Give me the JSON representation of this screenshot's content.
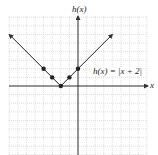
{
  "chart_data": {
    "type": "line",
    "title": "",
    "function_label": "h(x) = |x + 2|",
    "xlabel": "x",
    "ylabel": "h(x)",
    "xlim": [
      -8,
      8
    ],
    "ylim": [
      -8,
      8
    ],
    "grid": true,
    "series": [
      {
        "name": "h(x) = |x + 2|",
        "x": [
          -8,
          -4,
          -3,
          -2,
          -1,
          0,
          4
        ],
        "y": [
          6,
          2,
          1,
          0,
          1,
          2,
          6
        ],
        "marked_points": [
          [
            -4,
            2
          ],
          [
            -3,
            1
          ],
          [
            -2,
            0
          ],
          [
            -1,
            1
          ],
          [
            0,
            2
          ]
        ],
        "arrows_at_ends": true
      }
    ]
  },
  "labels": {
    "y_axis": "h(x)",
    "x_axis": "x",
    "equation": "h(x) = |x + 2|"
  },
  "colors": {
    "grid": "#c8c8c8",
    "axis": "#333333",
    "curve": "#222222"
  }
}
